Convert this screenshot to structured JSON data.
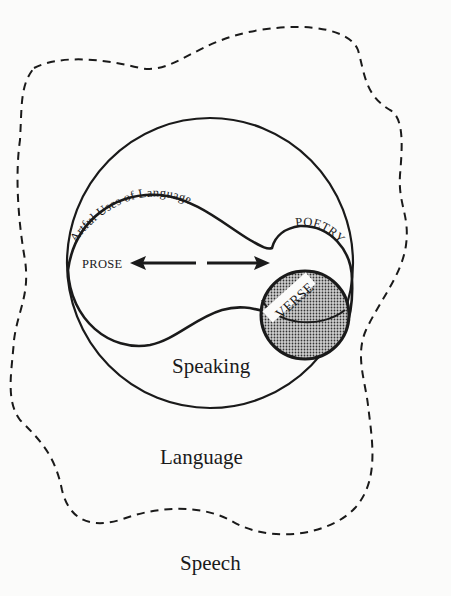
{
  "diagram": {
    "labels": {
      "artful_uses": "Artful Uses of Language",
      "prose": "PROSE",
      "poetry": "POETRY",
      "verse": "VERSE",
      "speaking": "Speaking",
      "language": "Language",
      "speech": "Speech"
    },
    "colors": {
      "ink": "#1a1a1a",
      "background": "#fbfbfa",
      "verse_fill": "#8a8a8a"
    }
  }
}
